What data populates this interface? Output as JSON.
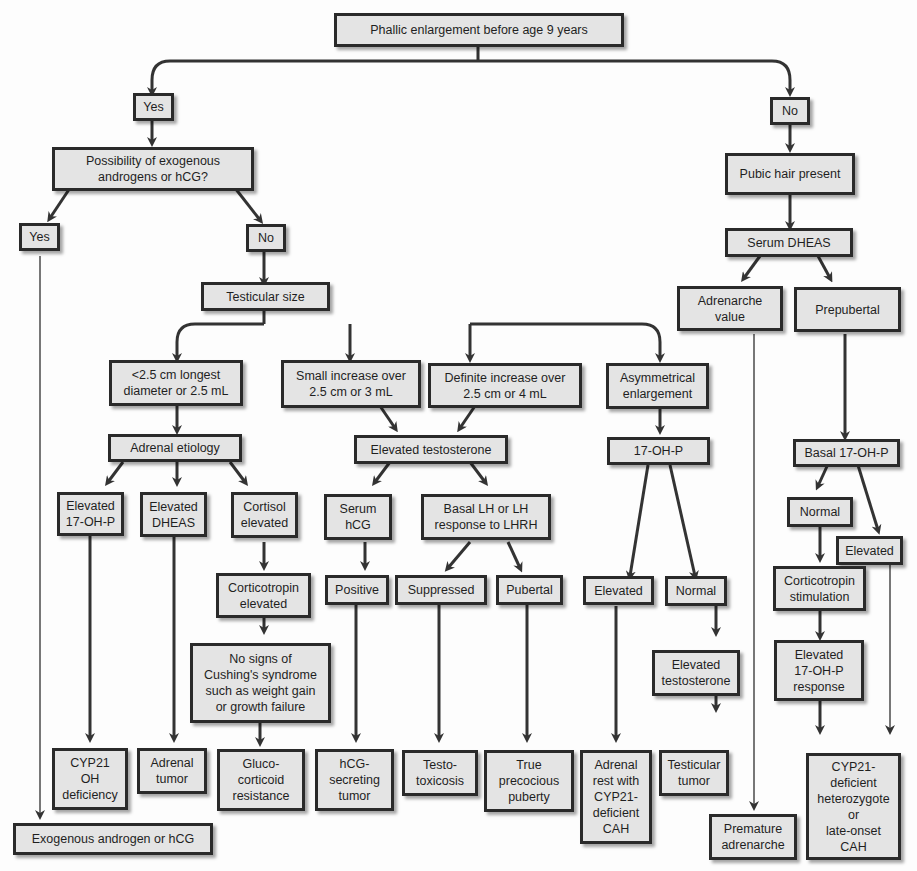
{
  "diagram": {
    "nodes": {
      "root": "Phallic enlargement before age 9 years",
      "yes1": "Yes",
      "no1": "No",
      "exo_q": "Possibility of exogenous\nandrogens or hCG?",
      "yes2": "Yes",
      "no2": "No",
      "testicular_size": "Testicular size",
      "small": "<2.5 cm longest\ndiameter or 2.5 mL",
      "small_inc": "Small increase over\n2.5 cm or 3 mL",
      "definite_inc": "Definite increase over\n2.5 cm or 4 mL",
      "asym": "Asymmetrical\nenlargement",
      "adrenal_etiology": "Adrenal etiology",
      "elev_17ohp": "Elevated\n17-OH-P",
      "elev_dheas": "Elevated\nDHEAS",
      "cortisol_elev": "Cortisol\nelevated",
      "cortico_elev": "Corticotropin\nelevated",
      "no_cushing": "No signs of\nCushing's syndrome\nsuch as weight gain\nor growth failure",
      "elev_testo": "Elevated testosterone",
      "serum_hcg": "Serum\nhCG",
      "basal_lh": "Basal LH or LH\nresponse to LHRH",
      "positive": "Positive",
      "suppressed": "Suppressed",
      "pubertal": "Pubertal",
      "ohp_asym": "17-OH-P",
      "asym_elevated": "Elevated",
      "asym_normal": "Normal",
      "asym_elev_testo": "Elevated\ntestosterone",
      "pubic_hair": "Pubic hair present",
      "serum_dheas": "Serum DHEAS",
      "adrenarche_value": "Adrenarche\nvalue",
      "prepubertal": "Prepubertal",
      "basal_17ohp": "Basal 17-OH-P",
      "r_normal": "Normal",
      "r_elevated": "Elevated",
      "cortico_stim": "Corticotropin\nstimulation",
      "elev_17ohp_resp": "Elevated\n17-OH-P\nresponse",
      "cyp21_oh": "CYP21\nOH\ndeficiency",
      "adrenal_tumor": "Adrenal\ntumor",
      "gluco_res": "Gluco-\ncorticoid\nresistance",
      "hcg_tumor": "hCG-\nsecreting\ntumor",
      "testotox": "Testo-\ntoxicosis",
      "true_precocious": "True\nprecocious\npuberty",
      "adrenal_rest": "Adrenal\nrest with\nCYP21-\ndeficient\nCAH",
      "testicular_tumor": "Testicular\ntumor",
      "exogenous": "Exogenous androgen or hCG",
      "premature_adrenarche": "Premature\nadrenarche",
      "cyp21_hetero": "CYP21-\ndeficient\nheterozygote\nor\nlate-onset\nCAH"
    }
  },
  "colors": {
    "box_fill": "#e4e4e4",
    "box_border": "#2a2a2a",
    "arrow": "#333333"
  }
}
